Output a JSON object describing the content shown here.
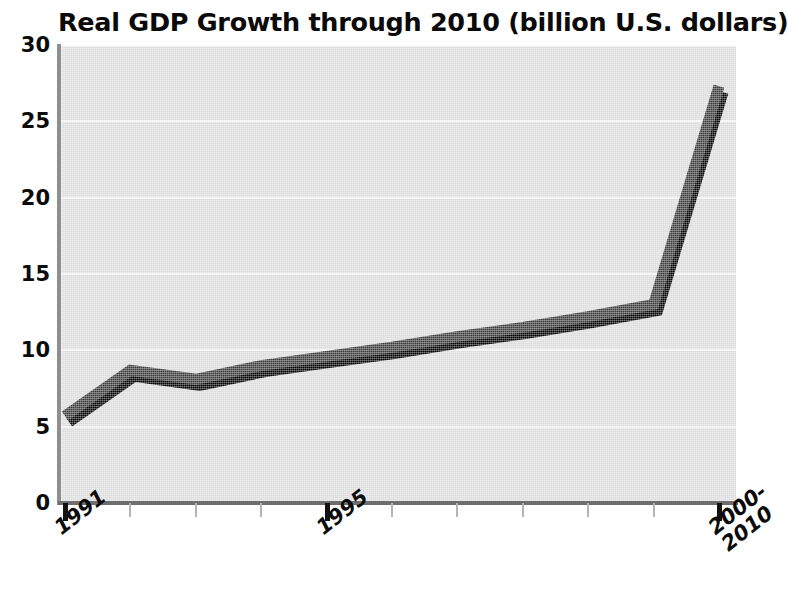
{
  "chart_data": {
    "type": "line",
    "title": "Real GDP Growth through 2010 (billion U.S. dollars)",
    "xlabel": "",
    "ylabel": "",
    "ylim": [
      0,
      30
    ],
    "ytick_values": [
      0,
      5,
      10,
      15,
      20,
      25,
      30
    ],
    "ytick_labels": [
      "0",
      "5",
      "10",
      "15",
      "20",
      "25",
      "30"
    ],
    "grid": true,
    "grid_axis": "y",
    "legend": false,
    "legend_position": "none",
    "x": [
      1991,
      1992,
      1993,
      1994,
      1995,
      1996,
      1997,
      1998,
      1999,
      2000,
      2010
    ],
    "xtick_positions": [
      1991,
      1992,
      1993,
      1994,
      1995,
      1996,
      1997,
      1998,
      1999,
      2000,
      2010
    ],
    "xtick_labels": [
      "1991",
      "",
      "",
      "",
      "1995",
      "",
      "",
      "",
      "",
      "",
      "2000-\n2010"
    ],
    "xtick_major": [
      true,
      false,
      false,
      false,
      true,
      false,
      false,
      false,
      false,
      false,
      true
    ],
    "values": [
      5.7,
      8.7,
      8.1,
      9.0,
      9.6,
      10.2,
      10.9,
      11.5,
      12.2,
      13.0,
      27.3
    ],
    "series": [
      {
        "name": "Real GDP Growth",
        "values": [
          5.7,
          8.7,
          8.1,
          9.0,
          9.6,
          10.2,
          10.9,
          11.5,
          12.2,
          13.0,
          27.3
        ]
      }
    ],
    "colors": {
      "line": "#3c3c3c",
      "line_shadow": "#000000",
      "plot_background": "#dcdcdc",
      "gridline": "#f2f2f2",
      "axis": "#6e6e6e",
      "text": "#0b0b0b"
    }
  }
}
